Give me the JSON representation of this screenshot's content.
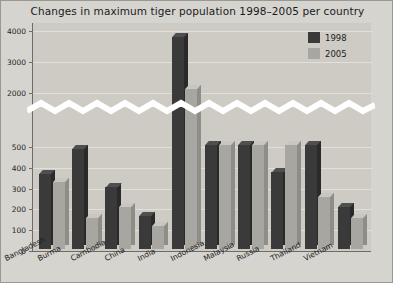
{
  "chart_data": {
    "type": "bar",
    "title": "Changes in maximum tiger population 1998–2005 per country",
    "xlabel": "",
    "ylabel": "",
    "categories": [
      "Bangladesh",
      "Burma",
      "Cambodia",
      "China",
      "India",
      "Indonesia",
      "Malaysia",
      "Russia",
      "Thailand",
      "Vietnam"
    ],
    "series": [
      {
        "name": "1998",
        "color": "#3a3a3a",
        "values": [
          362,
          480,
          300,
          160,
          3750,
          500,
          500,
          370,
          500,
          200
        ]
      },
      {
        "name": "2005",
        "color": "#a8a6a1",
        "values": [
          320,
          150,
          200,
          110,
          2050,
          500,
          500,
          500,
          250,
          150
        ]
      }
    ],
    "ytick_labels": [
      "0",
      "100",
      "200",
      "300",
      "400",
      "500",
      "2000",
      "3000",
      "4000"
    ],
    "ytick_values": [
      0,
      100,
      200,
      300,
      400,
      500,
      2000,
      3000,
      4000
    ],
    "axis_break": true,
    "axis_break_between": [
      500,
      2000
    ],
    "ylim": [
      0,
      4000
    ],
    "grid": true,
    "legend_position": "top-right",
    "legend_entries": [
      "1998",
      "2005"
    ]
  },
  "legend": {
    "entries": [
      {
        "label": "1998",
        "color": "#3a3a3a"
      },
      {
        "label": "2005",
        "color": "#a8a6a1"
      }
    ]
  },
  "colors": {
    "background": "#d6d4cf",
    "plot_background": "#cecbc5",
    "axis": "#6e6c68",
    "gridline": "#e2e0da",
    "series_1998": "#3a3a3a",
    "series_2005": "#a8a6a1",
    "text": "#1b1b1b"
  }
}
